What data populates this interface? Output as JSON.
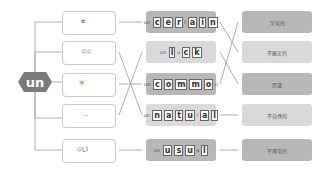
{
  "prefix": {
    "label": "un",
    "color": "#7a7a7a"
  },
  "pictures": [
    {
      "icon": "people-cheering-picture"
    },
    {
      "icon": "two-people-faces-picture"
    },
    {
      "icon": "dog-and-animals-picture"
    },
    {
      "icon": "spring-coil-picture"
    },
    {
      "icon": "person-speech-bubble-picture",
      "bubble": "My name is Mr. ..."
    }
  ],
  "words": [
    {
      "prefix": "un",
      "parts": [
        "c",
        "e",
        "r",
        "t",
        "a",
        "i",
        "n"
      ],
      "display": "uncertain"
    },
    {
      "prefix": "un",
      "parts": [
        "l",
        "u",
        "c",
        "k"
      ],
      "display": "unluck"
    },
    {
      "prefix": "un",
      "parts": [
        "c",
        "o",
        "m",
        "m",
        "o",
        "n"
      ],
      "display": "uncommon"
    },
    {
      "prefix": "un",
      "parts": [
        "n",
        "a",
        "t",
        "u",
        "r",
        "a",
        "l"
      ],
      "display": "unnatural"
    },
    {
      "prefix": "un",
      "parts": [
        "u",
        "s",
        "u",
        "a",
        "l"
      ],
      "display": "unusual"
    }
  ],
  "meanings": [
    {
      "label": "罕見的"
    },
    {
      "label": "不確定的"
    },
    {
      "label": "厄運"
    },
    {
      "label": "不自然的"
    },
    {
      "label": "不尋常的"
    }
  ]
}
